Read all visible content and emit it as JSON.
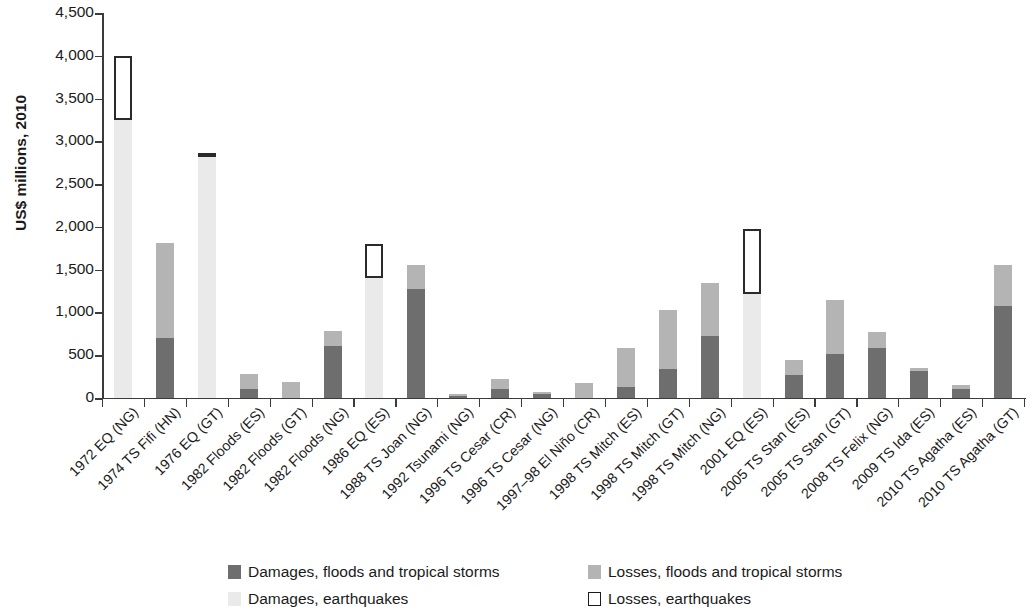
{
  "chart_data": {
    "type": "bar",
    "stacked": true,
    "title": "",
    "subtitle": "",
    "xlabel": "",
    "ylabel": "US$ millions, 2010",
    "ylim": [
      0,
      4500
    ],
    "ytick_interval": 500,
    "ytick_labels": [
      "4,500",
      "4,000",
      "3,500",
      "3,000",
      "2,500",
      "2,000",
      "1,500",
      "1,000",
      "500",
      "0"
    ],
    "ytick_values": [
      4500,
      4000,
      3500,
      3000,
      2500,
      2000,
      1500,
      1000,
      500,
      0
    ],
    "grid": false,
    "legend_position": "bottom",
    "categories": [
      "1972 EQ (NG)",
      "1974 TS Fifi (HN)",
      "1976 EQ (GT)",
      "1982 Floods (ES)",
      "1982 Floods (GT)",
      "1982 Floods (NG)",
      "1986 EQ (ES)",
      "1988 TS Joan (NG)",
      "1992 Tsunami (NG)",
      "1996 TS Cesar (CR)",
      "1996 TS Cesar (NG)",
      "1997–98 El Niño (CR)",
      "1998 TS Mitch (ES)",
      "1998 TS Mitch (GT)",
      "1998 TS Mitch (NG)",
      "2001 EQ (ES)",
      "2005 TS Stan (ES)",
      "2005 TS Stan (GT)",
      "2008 TS Felix (NG)",
      "2009 TS Ida (ES)",
      "2010 TS Agatha (ES)",
      "2010 TS Agatha (GT)"
    ],
    "series": [
      {
        "name": "Damages, floods and tropical storms",
        "color": "#6e6e6e",
        "values": [
          0,
          700,
          0,
          110,
          0,
          610,
          0,
          1280,
          20,
          100,
          50,
          0,
          130,
          340,
          720,
          0,
          270,
          520,
          590,
          310,
          100,
          1080
        ]
      },
      {
        "name": "Losses, floods and tropical storms",
        "color": "#b4b4b4",
        "values": [
          0,
          1115,
          0,
          170,
          190,
          175,
          0,
          280,
          10,
          125,
          25,
          170,
          450,
          690,
          630,
          0,
          170,
          630,
          180,
          40,
          50,
          480
        ]
      },
      {
        "name": "Damages, earthquakes",
        "color": "#eaeaea",
        "values": [
          3250,
          0,
          2820,
          0,
          0,
          0,
          1400,
          0,
          0,
          0,
          0,
          0,
          0,
          0,
          0,
          1220,
          0,
          0,
          0,
          0,
          0,
          0
        ]
      },
      {
        "name": "Losses, earthquakes",
        "color": "#ffffff",
        "values": [
          750,
          0,
          40,
          0,
          0,
          0,
          400,
          0,
          0,
          0,
          0,
          0,
          0,
          0,
          0,
          760,
          0,
          0,
          0,
          0,
          0,
          0
        ]
      }
    ],
    "totals": [
      4000,
      1815,
      2860,
      280,
      190,
      785,
      1800,
      1560,
      30,
      225,
      75,
      170,
      580,
      1030,
      1350,
      1980,
      440,
      1150,
      770,
      350,
      150,
      1560
    ]
  },
  "legend": {
    "items": [
      {
        "label": "Damages, floods and tropical storms",
        "swatch": "dmg-storm",
        "color": "#6e6e6e"
      },
      {
        "label": "Losses, floods and tropical storms",
        "swatch": "loss-storm",
        "color": "#b4b4b4"
      },
      {
        "label": "Damages, earthquakes",
        "swatch": "dmg-eq",
        "color": "#eaeaea"
      },
      {
        "label": "Losses, earthquakes",
        "swatch": "loss-eq",
        "color": "#ffffff"
      }
    ]
  }
}
